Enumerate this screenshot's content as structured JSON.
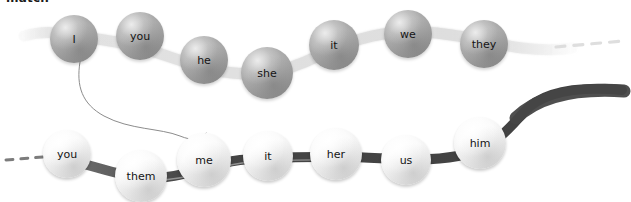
{
  "page": {
    "heading": "match",
    "background_color": "#ffffff"
  },
  "colors": {
    "subject_bubble": "#b0b0b0",
    "subject_ribbon": "#e2e2e2",
    "object_bubble": "#fafafa",
    "object_ribbon": "#4a4a4a",
    "text": "#141414",
    "connector_line": "#8c8c8c"
  },
  "chains": [
    {
      "id": "subject-chain",
      "name": "subject-pronoun-chain",
      "ribbon_style": "light",
      "ribbon_color": "#e2e2e2",
      "bubble_style": "grey",
      "bubbles": [
        {
          "label": "I",
          "cx": 74,
          "cy": 39,
          "r": 24
        },
        {
          "label": "you",
          "cx": 140,
          "cy": 36,
          "r": 24
        },
        {
          "label": "he",
          "cx": 204,
          "cy": 60,
          "r": 24
        },
        {
          "label": "she",
          "cx": 267,
          "cy": 73,
          "r": 26
        },
        {
          "label": "it",
          "cx": 334,
          "cy": 45,
          "r": 25
        },
        {
          "label": "we",
          "cx": 408,
          "cy": 34,
          "r": 24
        },
        {
          "label": "they",
          "cx": 484,
          "cy": 44,
          "r": 24
        }
      ]
    },
    {
      "id": "object-chain",
      "name": "object-pronoun-chain",
      "ribbon_style": "dark",
      "ribbon_color": "#4a4a4a",
      "bubble_style": "white",
      "bubbles": [
        {
          "label": "you",
          "cx": 67,
          "cy": 154,
          "r": 24
        },
        {
          "label": "them",
          "cx": 141,
          "cy": 176,
          "r": 26
        },
        {
          "label": "me",
          "cx": 204,
          "cy": 160,
          "r": 27
        },
        {
          "label": "it",
          "cx": 268,
          "cy": 156,
          "r": 25
        },
        {
          "label": "her",
          "cx": 336,
          "cy": 154,
          "r": 26
        },
        {
          "label": "us",
          "cx": 406,
          "cy": 160,
          "r": 25
        },
        {
          "label": "him",
          "cx": 480,
          "cy": 143,
          "r": 26
        }
      ]
    }
  ],
  "connectors": [
    {
      "name": "drawn-match-line",
      "from": "I",
      "to": "me",
      "from_point": [
        80,
        62
      ],
      "to_point": [
        206,
        133
      ]
    }
  ]
}
